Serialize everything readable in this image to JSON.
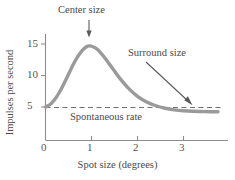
{
  "chart_data": {
    "type": "line",
    "title": "",
    "xlabel": "Spot size (degrees)",
    "ylabel": "Impulses per second",
    "xlim": [
      0,
      3.8
    ],
    "ylim": [
      0,
      16.5
    ],
    "xticks": [
      "0",
      "1",
      "2",
      "3"
    ],
    "xtick_values": [
      0,
      1,
      2,
      3
    ],
    "yticks": [
      "5",
      "10",
      "15"
    ],
    "ytick_values": [
      5,
      10,
      15
    ],
    "grid": false,
    "legend": "none",
    "series": [
      {
        "name": "Neural response",
        "color": "#9a9a9a",
        "x": [
          0.0,
          0.1,
          0.2,
          0.3,
          0.4,
          0.5,
          0.6,
          0.7,
          0.8,
          0.9,
          0.95,
          1.0,
          1.1,
          1.2,
          1.3,
          1.4,
          1.5,
          1.6,
          1.8,
          2.0,
          2.2,
          2.4,
          2.6,
          2.8,
          3.0,
          3.2,
          3.4,
          3.6,
          3.75
        ],
        "y": [
          5.0,
          5.4,
          6.2,
          7.3,
          8.7,
          10.2,
          11.7,
          13.0,
          14.0,
          14.6,
          14.7,
          14.65,
          14.3,
          13.6,
          12.7,
          11.7,
          10.7,
          9.7,
          8.0,
          6.7,
          5.8,
          5.2,
          4.8,
          4.55,
          4.4,
          4.32,
          4.28,
          4.25,
          4.25
        ]
      }
    ],
    "reference_line": {
      "label": "Spontaneous rate",
      "value": 4.2,
      "style": "dashed",
      "color": "#6f6f6f"
    },
    "annotations": [
      {
        "label": "Center size",
        "arrow": "down",
        "points_to_x": 0.95,
        "points_to_y": 14.7
      },
      {
        "label": "Surround size",
        "arrow": "diagonal-down-right",
        "points_to_x": 3.2,
        "points_to_y": 4.4
      }
    ]
  },
  "axes": {
    "y_tick_labels": [
      "5",
      "10",
      "15"
    ],
    "x_tick_labels": [
      "0",
      "1",
      "2",
      "3"
    ],
    "y_axis_title": "Impulses per second",
    "x_axis_title": "Spot size (degrees)"
  },
  "labels": {
    "center_size": "Center size",
    "surround_size": "Surround size",
    "spontaneous_rate": "Spontaneous rate"
  },
  "colors": {
    "curve": "#9a9a9a",
    "axis": "#8c8c8c",
    "text": "#4a4a4a",
    "dashed": "#6f6f6f",
    "arrow": "#5a5a5a",
    "background": "#ffffff"
  }
}
